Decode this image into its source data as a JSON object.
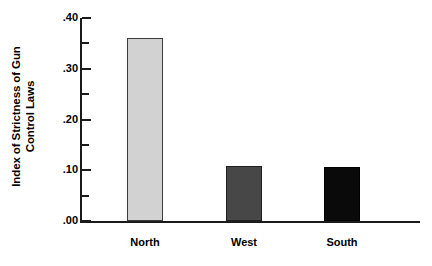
{
  "chart_data": {
    "type": "bar",
    "title": "",
    "subtitle": "",
    "xlabel": "",
    "ylabel": "Index of Strictness of Gun Control Laws",
    "ylabel_lines": [
      "Index of Strictness of Gun",
      "Control Laws"
    ],
    "categories": [
      "North",
      "West",
      "South"
    ],
    "values": [
      0.36,
      0.108,
      0.107
    ],
    "ylim": [
      0.0,
      0.4
    ],
    "ytick_values": [
      0.0,
      0.05,
      0.1,
      0.15,
      0.2,
      0.25,
      0.3,
      0.35,
      0.4
    ],
    "ytick_major_values": [
      0.0,
      0.1,
      0.2,
      0.3,
      0.4
    ],
    "ytick_major_labels": [
      ".00",
      ".10",
      ".20",
      ".30",
      ".40"
    ],
    "grid": false,
    "legend": "none",
    "bar_colors": [
      "#d2d2d2",
      "#474747",
      "#0a0a0a"
    ],
    "bar_edge_colors": [
      "#3c3c3c",
      "#1f1f1f",
      "#000000"
    ],
    "background_color": "#ffffff",
    "axis_color": "#1a1a1a",
    "text_color": "#000000",
    "series": [
      {
        "name": "Index of Strictness of Gun Control Laws",
        "values": [
          0.36,
          0.108,
          0.107
        ]
      }
    ],
    "points": [
      {
        "category": "North",
        "value": 0.36
      },
      {
        "category": "West",
        "value": 0.108
      },
      {
        "category": "South",
        "value": 0.107
      }
    ]
  }
}
